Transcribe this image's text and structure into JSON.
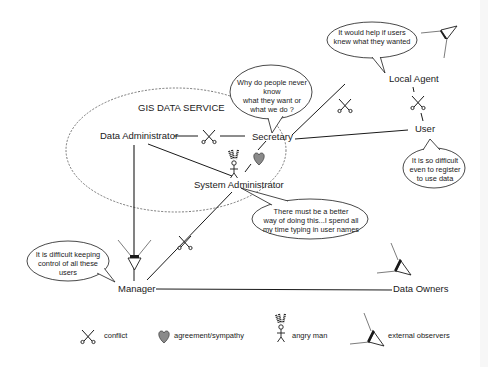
{
  "diagram": {
    "group_label": "GIS DATA SERVICE",
    "actors": {
      "data_administrator": "Data Administrator",
      "secretary": "Secretary",
      "system_administrator": "System Administrator",
      "local_agent": "Local Agent",
      "user": "User",
      "manager": "Manager",
      "data_owners": "Data Owners"
    },
    "speech_bubbles": {
      "local_agent": "It would help if users\nknew what they wanted",
      "secretary": "Why do people never know\nwhat they want or\nwhat we do ?",
      "user": "It is so difficult\neven to register\nto use data",
      "system_administrator": "There must be a better\nway of doing this...I spend all\nmy time typing in user names",
      "manager": "It is difficult keeping\ncontrol of all these\nusers"
    },
    "relationships": [
      {
        "from": "Data Administrator",
        "to": "Secretary",
        "type": "conflict"
      },
      {
        "from": "Data Administrator",
        "to": "System Administrator",
        "type": "link"
      },
      {
        "from": "Data Administrator",
        "to": "Manager",
        "type": "observed-arrow"
      },
      {
        "from": "Secretary",
        "to": "System Administrator",
        "type": "agreement/sympathy"
      },
      {
        "from": "Secretary",
        "to": "Local Agent",
        "type": "conflict"
      },
      {
        "from": "Secretary",
        "to": "User",
        "type": "link"
      },
      {
        "from": "Local Agent",
        "to": "User",
        "type": "conflict"
      },
      {
        "from": "System Administrator",
        "to": "Manager",
        "type": "conflict"
      },
      {
        "from": "Manager",
        "to": "Data Owners",
        "type": "link"
      }
    ],
    "icons": [
      "scissors-icon",
      "heart-icon",
      "angry-man-icon",
      "observer-eye-icon"
    ]
  },
  "legend": {
    "conflict": "conflict",
    "agreement": "agreement/sympathy",
    "angry_man": "angry man",
    "external_observers": "external observers"
  },
  "colors": {
    "line": "#1a1a1a",
    "dashed": "#555555",
    "heart": "#8a8a8a",
    "background": "#ffffff"
  }
}
